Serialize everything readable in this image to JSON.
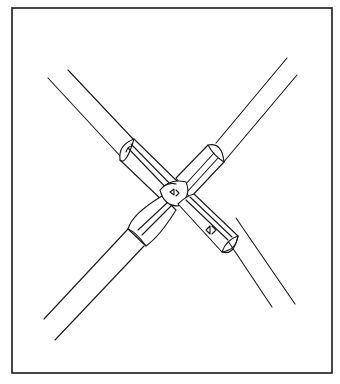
{
  "figure": {
    "stroke_color": "#1a1a1a",
    "background": "#ffffff",
    "border": {
      "x": 12,
      "y": 8,
      "width": 320,
      "height": 365
    },
    "pipes": [
      {
        "name": "pipe-a",
        "direction": "top-left to bottom-right",
        "edge1": [
          [
            48,
            78
          ],
          [
            272,
            307
          ]
        ],
        "edge2": [
          [
            68,
            70
          ],
          [
            295,
            304
          ]
        ]
      },
      {
        "name": "pipe-b",
        "direction": "top-right to bottom-left",
        "edge1": [
          [
            287,
            58
          ],
          [
            44,
            319
          ]
        ],
        "edge2": [
          [
            297,
            75
          ],
          [
            55,
            340
          ]
        ]
      }
    ],
    "coupling": {
      "center": [
        172,
        190
      ],
      "sleeves": [
        "upper-left",
        "upper-right",
        "lower-left",
        "lower-right"
      ],
      "markings": [
        "arrow-mark",
        "arrow-mark",
        "arrow-mark"
      ]
    }
  }
}
